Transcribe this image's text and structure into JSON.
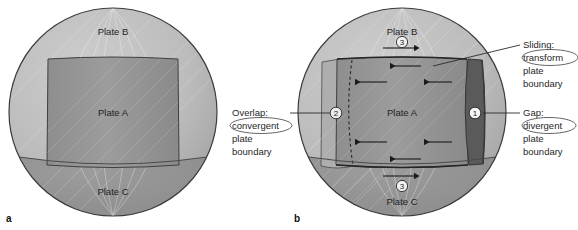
{
  "figure": {
    "type": "diagram",
    "background_color": "#ffffff"
  },
  "panels": [
    {
      "letter": "a",
      "caption_label": "a",
      "description": "Sphere with three plates meeting with no relative motion",
      "plates": [
        {
          "name": "Plate B",
          "region": "upper"
        },
        {
          "name": "Plate A",
          "region": "central"
        },
        {
          "name": "Plate C",
          "region": "lower"
        }
      ]
    },
    {
      "letter": "b",
      "caption_label": "b",
      "description": "Sphere with Plate A displaced westward producing gap, overlap and sliding boundaries",
      "plates": [
        {
          "name": "Plate B",
          "region": "upper"
        },
        {
          "name": "Plate A",
          "region": "central"
        },
        {
          "name": "Plate C",
          "region": "lower"
        }
      ],
      "markers": [
        {
          "id": "1",
          "label": "1",
          "style": "light-on-dark",
          "meaning": "Gap: divergent plate boundary"
        },
        {
          "id": "2",
          "label": "2",
          "style": "dark-on-light",
          "meaning": "Overlap: convergent plate boundary"
        },
        {
          "id": "3t",
          "label": "3",
          "style": "dark-on-light",
          "meaning": "Sliding: transform plate boundary (north)"
        },
        {
          "id": "3b",
          "label": "3",
          "style": "dark-on-light",
          "meaning": "Sliding: transform plate boundary (south)"
        }
      ]
    }
  ],
  "annotations": [
    {
      "id": "sliding",
      "lines": [
        "Sliding:",
        "transform",
        "plate",
        "boundary"
      ],
      "circled_word": "transform",
      "position": "right-top",
      "points_to_marker": "3t"
    },
    {
      "id": "gap",
      "lines": [
        "Gap:",
        "divergent",
        "plate",
        "boundary"
      ],
      "circled_word": "divergent",
      "position": "right-bottom",
      "points_to_marker": "1"
    },
    {
      "id": "overlap",
      "lines": [
        "Overlap:",
        "convergent",
        "plate",
        "boundary"
      ],
      "circled_word": "convergent",
      "position": "center-left-of-panel-b",
      "points_to_marker": "2"
    }
  ],
  "colors": {
    "sphere_upper": "#b8b8b8",
    "sphere_lower": "#8e8e8e",
    "plate_a": "#989898",
    "plate_a_dark": "#7a7a7a",
    "gap_band": "#555555",
    "overlap_band": "#a8a8a8",
    "outline": "#3a3a3a",
    "text": "#1f1f1f"
  },
  "motion": {
    "plate_a_direction": "west",
    "arrow_count_interior": 4,
    "arrow_count_transform": 4
  }
}
